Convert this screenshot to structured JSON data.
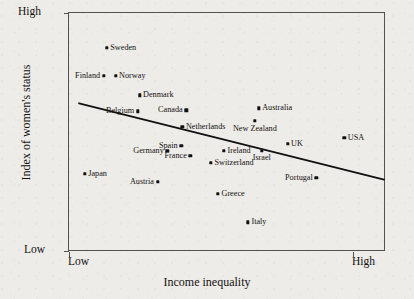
{
  "chart_data": {
    "type": "scatter",
    "title": "",
    "xlabel": "Income inequality",
    "ylabel": "Index of women's status",
    "x_tick_labels": [
      "Low",
      "High"
    ],
    "y_tick_labels": [
      "Low",
      "High"
    ],
    "xlim": [
      "Low",
      "High"
    ],
    "ylim": [
      "Low",
      "High"
    ],
    "grid": false,
    "legend": "none",
    "annotations": [
      "Downward-sloping fitted trend line from upper-left to lower-right"
    ],
    "trend_line": {
      "x_start_pct": 3.2,
      "y_start_pct": 38.1,
      "x_end_pct": 100,
      "y_end_pct": 70.3
    },
    "points": [
      {
        "label": "Sweden",
        "x_pct": 12.0,
        "y_pct": 14.6,
        "label_side": "right"
      },
      {
        "label": "Finland",
        "x_pct": 11.0,
        "y_pct": 26.4,
        "label_side": "left"
      },
      {
        "label": "Norway",
        "x_pct": 14.8,
        "y_pct": 26.4,
        "label_side": "right"
      },
      {
        "label": "Denmark",
        "x_pct": 22.4,
        "y_pct": 34.7,
        "label_side": "right"
      },
      {
        "label": "Belgium",
        "x_pct": 21.8,
        "y_pct": 41.4,
        "label_side": "left"
      },
      {
        "label": "Canada",
        "x_pct": 37.2,
        "y_pct": 41.0,
        "label_side": "left"
      },
      {
        "label": "Netherlands",
        "x_pct": 36.0,
        "y_pct": 48.1,
        "label_side": "right"
      },
      {
        "label": "Australia",
        "x_pct": 60.2,
        "y_pct": 40.2,
        "label_side": "right"
      },
      {
        "label": "New Zealand",
        "x_pct": 59.0,
        "y_pct": 45.6,
        "label_side": "below"
      },
      {
        "label": "USA",
        "x_pct": 87.4,
        "y_pct": 52.7,
        "label_side": "right"
      },
      {
        "label": "Spain",
        "x_pct": 35.6,
        "y_pct": 56.1,
        "label_side": "left"
      },
      {
        "label": "Germany",
        "x_pct": 31.2,
        "y_pct": 58.2,
        "label_side": "left"
      },
      {
        "label": "France",
        "x_pct": 38.5,
        "y_pct": 60.3,
        "label_side": "left"
      },
      {
        "label": "Ireland",
        "x_pct": 49.2,
        "y_pct": 58.2,
        "label_side": "right"
      },
      {
        "label": "Israel",
        "x_pct": 61.2,
        "y_pct": 58.2,
        "label_side": "below"
      },
      {
        "label": "UK",
        "x_pct": 69.4,
        "y_pct": 55.2,
        "label_side": "right"
      },
      {
        "label": "Switzerland",
        "x_pct": 45.1,
        "y_pct": 63.2,
        "label_side": "right"
      },
      {
        "label": "Portugal",
        "x_pct": 78.5,
        "y_pct": 69.5,
        "label_side": "left"
      },
      {
        "label": "Japan",
        "x_pct": 5.0,
        "y_pct": 67.8,
        "label_side": "right"
      },
      {
        "label": "Austria",
        "x_pct": 28.1,
        "y_pct": 71.1,
        "label_side": "left"
      },
      {
        "label": "Greece",
        "x_pct": 47.3,
        "y_pct": 76.2,
        "label_side": "right"
      },
      {
        "label": "Italy",
        "x_pct": 56.8,
        "y_pct": 88.3,
        "label_side": "right"
      }
    ]
  }
}
